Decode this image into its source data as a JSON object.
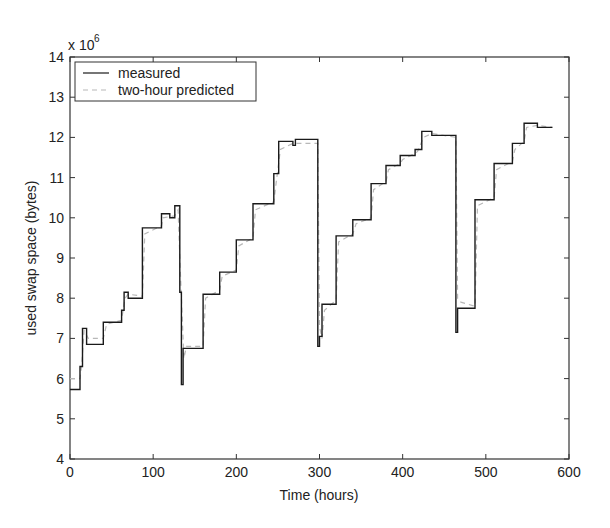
{
  "chart_data": {
    "type": "line",
    "title": "",
    "xlabel": "Time (hours)",
    "ylabel": "used swap space (bytes)",
    "y_multiplier_label": "x 10",
    "y_multiplier_exponent": "6",
    "xlim": [
      0,
      600
    ],
    "ylim": [
      4,
      14
    ],
    "xticks": [
      0,
      100,
      200,
      300,
      400,
      500,
      600
    ],
    "yticks": [
      4,
      5,
      6,
      7,
      8,
      9,
      10,
      11,
      12,
      13,
      14
    ],
    "grid": false,
    "legend_position": "upper left",
    "legend": [
      "measured",
      "two-hour predicted"
    ],
    "series": [
      {
        "name": "measured",
        "style": "solid",
        "color": "#1a1a1a",
        "step_points": [
          [
            0,
            5.73
          ],
          [
            12,
            5.73
          ],
          [
            12,
            6.3
          ],
          [
            15,
            6.3
          ],
          [
            15,
            7.25
          ],
          [
            20,
            7.25
          ],
          [
            20,
            6.85
          ],
          [
            40,
            6.85
          ],
          [
            40,
            7.4
          ],
          [
            62,
            7.4
          ],
          [
            62,
            7.7
          ],
          [
            65,
            7.7
          ],
          [
            65,
            8.15
          ],
          [
            70,
            8.15
          ],
          [
            70,
            8.0
          ],
          [
            87,
            8.0
          ],
          [
            87,
            9.75
          ],
          [
            110,
            9.75
          ],
          [
            110,
            10.1
          ],
          [
            120,
            10.1
          ],
          [
            120,
            10.0
          ],
          [
            126,
            10.0
          ],
          [
            126,
            10.3
          ],
          [
            132,
            10.3
          ],
          [
            132,
            8.15
          ],
          [
            134,
            8.15
          ],
          [
            134,
            5.85
          ],
          [
            136,
            5.85
          ],
          [
            136,
            6.75
          ],
          [
            160,
            6.75
          ],
          [
            160,
            8.1
          ],
          [
            180,
            8.1
          ],
          [
            180,
            8.65
          ],
          [
            200,
            8.65
          ],
          [
            200,
            9.45
          ],
          [
            220,
            9.45
          ],
          [
            220,
            10.35
          ],
          [
            245,
            10.35
          ],
          [
            245,
            11.1
          ],
          [
            251,
            11.1
          ],
          [
            251,
            11.9
          ],
          [
            268,
            11.9
          ],
          [
            268,
            11.8
          ],
          [
            271,
            11.8
          ],
          [
            271,
            11.95
          ],
          [
            298,
            11.95
          ],
          [
            298,
            6.8
          ],
          [
            300,
            6.8
          ],
          [
            300,
            7.05
          ],
          [
            303,
            7.05
          ],
          [
            303,
            7.85
          ],
          [
            320,
            7.85
          ],
          [
            320,
            9.55
          ],
          [
            340,
            9.55
          ],
          [
            340,
            9.95
          ],
          [
            362,
            9.95
          ],
          [
            362,
            10.85
          ],
          [
            380,
            10.85
          ],
          [
            380,
            11.3
          ],
          [
            397,
            11.3
          ],
          [
            397,
            11.55
          ],
          [
            415,
            11.55
          ],
          [
            415,
            11.7
          ],
          [
            423,
            11.7
          ],
          [
            423,
            12.15
          ],
          [
            435,
            12.15
          ],
          [
            435,
            12.05
          ],
          [
            464,
            12.05
          ],
          [
            464,
            7.15
          ],
          [
            466,
            7.15
          ],
          [
            466,
            7.75
          ],
          [
            487,
            7.75
          ],
          [
            487,
            10.45
          ],
          [
            510,
            10.45
          ],
          [
            510,
            11.35
          ],
          [
            532,
            11.35
          ],
          [
            532,
            11.85
          ],
          [
            546,
            11.85
          ],
          [
            546,
            12.35
          ],
          [
            562,
            12.35
          ],
          [
            562,
            12.25
          ],
          [
            580,
            12.25
          ]
        ]
      },
      {
        "name": "two-hour predicted",
        "style": "dashed",
        "color": "#b8b8b8",
        "points": [
          [
            0,
            6.0
          ],
          [
            12,
            6.0
          ],
          [
            14,
            6.3
          ],
          [
            17,
            7.2
          ],
          [
            22,
            7.0
          ],
          [
            40,
            7.0
          ],
          [
            44,
            7.35
          ],
          [
            62,
            7.45
          ],
          [
            66,
            8.0
          ],
          [
            70,
            8.1
          ],
          [
            87,
            8.05
          ],
          [
            90,
            9.6
          ],
          [
            110,
            9.8
          ],
          [
            112,
            10.0
          ],
          [
            126,
            10.05
          ],
          [
            130,
            10.2
          ],
          [
            133,
            8.5
          ],
          [
            137,
            6.5
          ],
          [
            140,
            6.8
          ],
          [
            160,
            6.8
          ],
          [
            163,
            8.0
          ],
          [
            180,
            8.2
          ],
          [
            183,
            8.55
          ],
          [
            200,
            8.7
          ],
          [
            203,
            9.3
          ],
          [
            220,
            9.5
          ],
          [
            223,
            10.2
          ],
          [
            245,
            10.4
          ],
          [
            248,
            10.9
          ],
          [
            253,
            11.7
          ],
          [
            268,
            11.85
          ],
          [
            272,
            11.85
          ],
          [
            298,
            11.85
          ],
          [
            300,
            7.3
          ],
          [
            303,
            7.0
          ],
          [
            306,
            7.7
          ],
          [
            320,
            7.95
          ],
          [
            323,
            9.4
          ],
          [
            340,
            9.6
          ],
          [
            344,
            9.85
          ],
          [
            362,
            10.0
          ],
          [
            365,
            10.7
          ],
          [
            380,
            10.9
          ],
          [
            383,
            11.2
          ],
          [
            397,
            11.35
          ],
          [
            400,
            11.45
          ],
          [
            415,
            11.6
          ],
          [
            418,
            11.65
          ],
          [
            425,
            12.0
          ],
          [
            435,
            12.1
          ],
          [
            464,
            12.0
          ],
          [
            466,
            8.0
          ],
          [
            470,
            7.9
          ],
          [
            487,
            7.8
          ],
          [
            490,
            10.3
          ],
          [
            510,
            10.5
          ],
          [
            513,
            11.2
          ],
          [
            532,
            11.4
          ],
          [
            535,
            11.7
          ],
          [
            546,
            11.9
          ],
          [
            549,
            12.25
          ],
          [
            562,
            12.3
          ],
          [
            580,
            12.25
          ]
        ]
      }
    ]
  }
}
